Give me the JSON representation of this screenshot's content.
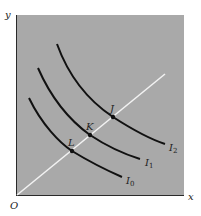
{
  "diagram": {
    "type": "indifference-curves",
    "colors": {
      "panel": "#a9a9a9",
      "axis": "#2a2a2a",
      "curve": "#111111",
      "ray": "#f2f2f2",
      "background": "#ffffff"
    },
    "axes": {
      "x_label": "x",
      "y_label": "y",
      "origin_label": "O"
    },
    "curves": [
      {
        "name": "I",
        "subscript": "0",
        "point": "L"
      },
      {
        "name": "I",
        "subscript": "1",
        "point": "K"
      },
      {
        "name": "I",
        "subscript": "2",
        "point": "J"
      }
    ],
    "points": {
      "L": "L",
      "K": "K",
      "J": "J"
    }
  }
}
